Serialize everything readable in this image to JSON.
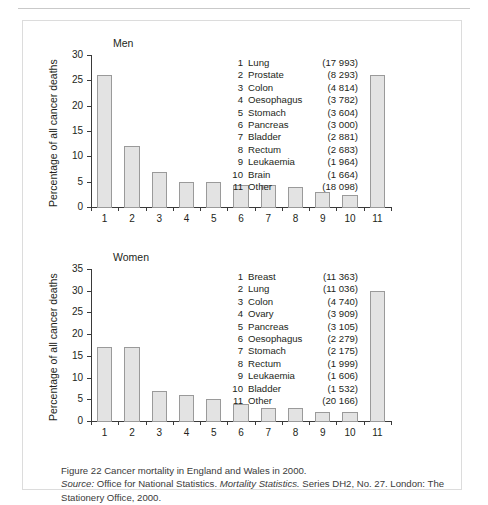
{
  "figure": {
    "caption_line1": "Figure 22  Cancer mortality in England and Wales in 2000.",
    "source_label": "Source:",
    "source_rest": " Office for National Statistics. ",
    "source_italic_title": "Mortality Statistics.",
    "source_tail": " Series DH2, No. 27. London: The Stationery Office, 2000.",
    "colors": {
      "bar_fill": "#e3e3e3",
      "bar_stroke": "#9a9a9a",
      "axis": "#3a3a3a",
      "text": "#231f20",
      "border": "#dcdcdc"
    }
  },
  "chart_data": [
    {
      "type": "bar",
      "title": "Men",
      "xlabel": "",
      "ylabel": "Percentage of all cancer deaths",
      "ylim": [
        0,
        30
      ],
      "yticks": [
        0,
        5,
        10,
        15,
        20,
        25,
        30
      ],
      "grid": false,
      "legend_position": "inside-upper-right",
      "categories": [
        "1",
        "2",
        "3",
        "4",
        "5",
        "6",
        "7",
        "8",
        "9",
        "10",
        "11"
      ],
      "values": [
        26,
        12,
        7,
        5,
        5,
        4.3,
        4.3,
        4,
        3,
        2.4,
        26
      ],
      "legend": [
        {
          "num": "1",
          "name": "Lung",
          "value": "(17 993)"
        },
        {
          "num": "2",
          "name": "Prostate",
          "value": "(8 293)"
        },
        {
          "num": "3",
          "name": "Colon",
          "value": "(4 814)"
        },
        {
          "num": "4",
          "name": "Oesophagus",
          "value": "(3 782)"
        },
        {
          "num": "5",
          "name": "Stomach",
          "value": "(3 604)"
        },
        {
          "num": "6",
          "name": "Pancreas",
          "value": "(3 000)"
        },
        {
          "num": "7",
          "name": "Bladder",
          "value": "(2 881)"
        },
        {
          "num": "8",
          "name": "Rectum",
          "value": "(2 683)"
        },
        {
          "num": "9",
          "name": "Leukaemia",
          "value": "(1 964)"
        },
        {
          "num": "10",
          "name": "Brain",
          "value": "(1 664)"
        },
        {
          "num": "11",
          "name": "Other",
          "value": "(18 098)"
        }
      ]
    },
    {
      "type": "bar",
      "title": "Women",
      "xlabel": "",
      "ylabel": "Percentage of all cancer deaths",
      "ylim": [
        0,
        35
      ],
      "yticks": [
        0,
        5,
        10,
        15,
        20,
        25,
        30,
        35
      ],
      "grid": false,
      "legend_position": "inside-upper-right",
      "categories": [
        "1",
        "2",
        "3",
        "4",
        "5",
        "6",
        "7",
        "8",
        "9",
        "10",
        "11"
      ],
      "values": [
        17,
        17,
        7,
        6,
        5,
        4,
        3,
        3,
        2,
        2,
        30
      ],
      "legend": [
        {
          "num": "1",
          "name": "Breast",
          "value": "(11 363)"
        },
        {
          "num": "2",
          "name": "Lung",
          "value": "(11 036)"
        },
        {
          "num": "3",
          "name": "Colon",
          "value": "(4 740)"
        },
        {
          "num": "4",
          "name": "Ovary",
          "value": "(3 909)"
        },
        {
          "num": "5",
          "name": "Pancreas",
          "value": "(3 105)"
        },
        {
          "num": "6",
          "name": "Oesophagus",
          "value": "(2 279)"
        },
        {
          "num": "7",
          "name": "Stomach",
          "value": "(2 175)"
        },
        {
          "num": "8",
          "name": "Rectum",
          "value": "(1 999)"
        },
        {
          "num": "9",
          "name": "Leukaemia",
          "value": "(1 606)"
        },
        {
          "num": "10",
          "name": "Bladder",
          "value": "(1 532)"
        },
        {
          "num": "11",
          "name": "Other",
          "value": "(20 166)"
        }
      ]
    }
  ]
}
